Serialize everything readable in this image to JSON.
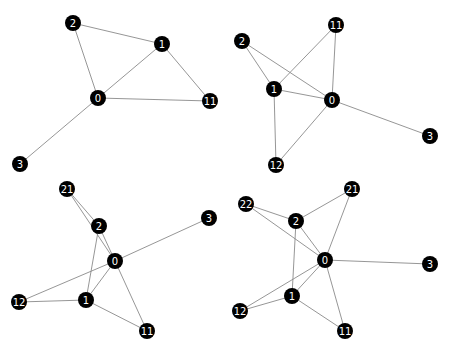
{
  "chart_data": {
    "type": "network",
    "title": "",
    "node_color": "#000000",
    "label_color": "#ffffff",
    "edge_color": "#8a8a8a",
    "node_radius": 8,
    "graphs": [
      {
        "panel": "top-left",
        "nodes": [
          {
            "id": "0",
            "x": 98,
            "y": 98
          },
          {
            "id": "1",
            "x": 162,
            "y": 44
          },
          {
            "id": "2",
            "x": 73,
            "y": 23
          },
          {
            "id": "3",
            "x": 20,
            "y": 164
          },
          {
            "id": "11",
            "x": 210,
            "y": 101
          }
        ],
        "edges": [
          [
            "2",
            "1"
          ],
          [
            "2",
            "0"
          ],
          [
            "1",
            "0"
          ],
          [
            "1",
            "11"
          ],
          [
            "0",
            "11"
          ],
          [
            "0",
            "3"
          ]
        ]
      },
      {
        "panel": "top-right",
        "nodes": [
          {
            "id": "0",
            "x": 332,
            "y": 100
          },
          {
            "id": "1",
            "x": 274,
            "y": 89
          },
          {
            "id": "2",
            "x": 242,
            "y": 41
          },
          {
            "id": "3",
            "x": 430,
            "y": 136
          },
          {
            "id": "11",
            "x": 336,
            "y": 25
          },
          {
            "id": "12",
            "x": 276,
            "y": 165
          }
        ],
        "edges": [
          [
            "2",
            "1"
          ],
          [
            "2",
            "0"
          ],
          [
            "1",
            "11"
          ],
          [
            "11",
            "0"
          ],
          [
            "1",
            "0"
          ],
          [
            "1",
            "12"
          ],
          [
            "12",
            "0"
          ],
          [
            "0",
            "3"
          ]
        ]
      },
      {
        "panel": "bottom-left",
        "nodes": [
          {
            "id": "0",
            "x": 115,
            "y": 261
          },
          {
            "id": "1",
            "x": 86,
            "y": 300
          },
          {
            "id": "2",
            "x": 99,
            "y": 226
          },
          {
            "id": "3",
            "x": 209,
            "y": 218
          },
          {
            "id": "11",
            "x": 147,
            "y": 331
          },
          {
            "id": "12",
            "x": 19,
            "y": 302
          },
          {
            "id": "21",
            "x": 67,
            "y": 189
          }
        ],
        "edges": [
          [
            "21",
            "2"
          ],
          [
            "21",
            "0"
          ],
          [
            "2",
            "0"
          ],
          [
            "2",
            "1"
          ],
          [
            "0",
            "3"
          ],
          [
            "0",
            "12"
          ],
          [
            "0",
            "1"
          ],
          [
            "0",
            "11"
          ],
          [
            "12",
            "1"
          ],
          [
            "1",
            "11"
          ]
        ]
      },
      {
        "panel": "bottom-right",
        "nodes": [
          {
            "id": "0",
            "x": 325,
            "y": 260
          },
          {
            "id": "1",
            "x": 292,
            "y": 296
          },
          {
            "id": "2",
            "x": 296,
            "y": 221
          },
          {
            "id": "3",
            "x": 430,
            "y": 264
          },
          {
            "id": "11",
            "x": 345,
            "y": 331
          },
          {
            "id": "12",
            "x": 240,
            "y": 311
          },
          {
            "id": "21",
            "x": 352,
            "y": 189
          },
          {
            "id": "22",
            "x": 246,
            "y": 204
          }
        ],
        "edges": [
          [
            "22",
            "2"
          ],
          [
            "22",
            "0"
          ],
          [
            "2",
            "21"
          ],
          [
            "21",
            "0"
          ],
          [
            "2",
            "0"
          ],
          [
            "2",
            "1"
          ],
          [
            "0",
            "3"
          ],
          [
            "0",
            "12"
          ],
          [
            "0",
            "1"
          ],
          [
            "0",
            "11"
          ],
          [
            "12",
            "1"
          ],
          [
            "1",
            "11"
          ]
        ]
      }
    ]
  }
}
